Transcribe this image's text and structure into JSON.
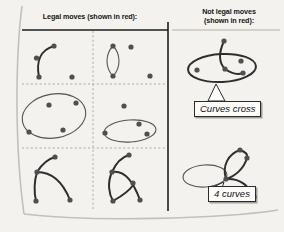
{
  "figure": {
    "background_color": "#f4f2ef",
    "ink_color": "#2b2b2b",
    "dot_color": "#4a4a4a",
    "headers": {
      "left": "Legal moves (shown in red):",
      "right_line1": "Not legal moves",
      "right_line2": "(shown in red):"
    },
    "callouts": [
      {
        "id": "curves-cross",
        "label": "Curves cross"
      },
      {
        "id": "four-curves",
        "label": "4 curves"
      }
    ],
    "left_panel": {
      "title": "Legal moves (shown in red):",
      "cells": [
        {
          "row": 1,
          "col": 1,
          "description": "single arc joining three dots, one free dot"
        },
        {
          "row": 1,
          "col": 2,
          "description": "vertical closed loop through two dots, two free dots"
        },
        {
          "row": 2,
          "col": 1,
          "description": "large tilted ellipse with dots on and inside it"
        },
        {
          "row": 2,
          "col": 2,
          "description": "horizontal ellipse with dots, one free dot above"
        },
        {
          "row": 3,
          "col": 1,
          "description": "two arcs branching from a node, four dots"
        },
        {
          "row": 3,
          "col": 2,
          "description": "loop with two branching arcs, four dots"
        }
      ]
    },
    "right_panel": {
      "title_line1": "Not legal moves",
      "title_line2": "(shown in red):",
      "examples": [
        {
          "id": "curves-cross",
          "description": "ellipse with a curve crossing through it",
          "label": "Curves cross"
        },
        {
          "id": "four-curves",
          "description": "node with four curves meeting at a single point",
          "label": "4 curves"
        }
      ]
    }
  }
}
